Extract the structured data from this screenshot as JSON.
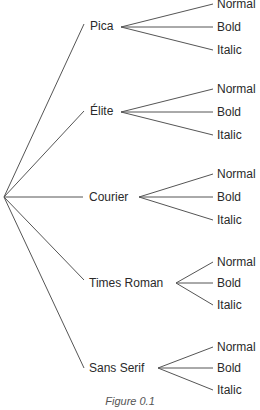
{
  "diagram": {
    "type": "tree",
    "root": "",
    "branches": [
      {
        "label": "Pica",
        "children": [
          "Normal",
          "Bold",
          "Italic"
        ]
      },
      {
        "label": "Élite",
        "children": [
          "Normal",
          "Bold",
          "Italic"
        ]
      },
      {
        "label": "Courier",
        "children": [
          "Normal",
          "Bold",
          "Italic"
        ]
      },
      {
        "label": "Times Roman",
        "children": [
          "Normal",
          "Bold",
          "Italic"
        ]
      },
      {
        "label": "Sans Serif",
        "children": [
          "Normal",
          "Bold",
          "Italic"
        ]
      }
    ],
    "caption": "Figure 0.1"
  }
}
